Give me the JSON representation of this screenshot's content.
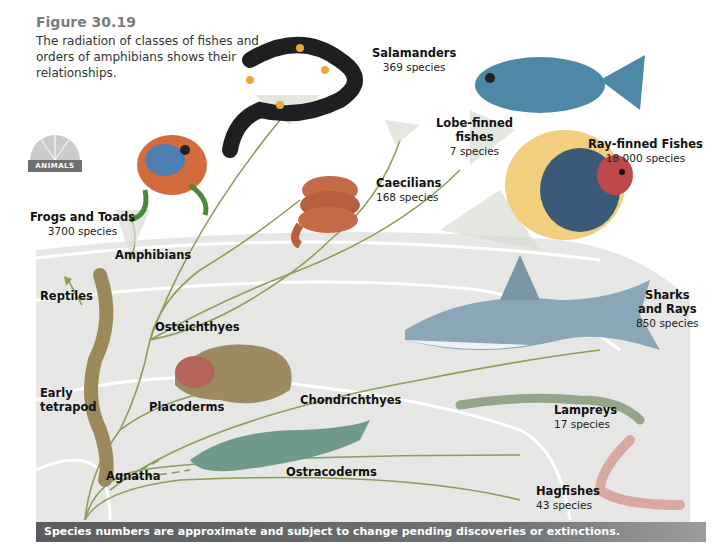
{
  "figure": {
    "title": "Figure 30.19",
    "caption": "The radiation of classes of fishes and orders of amphibians shows their relationships."
  },
  "badge": {
    "label": "ANIMALS",
    "icon": "nautilus-shell-icon"
  },
  "groups": {
    "frogs": {
      "name": "Frogs and Toads",
      "species": "3700 species"
    },
    "salamanders": {
      "name": "Salamanders",
      "species": "369 species"
    },
    "caecilians": {
      "name": "Caecilians",
      "species": "168 species"
    },
    "lobe_finned": {
      "name_line1": "Lobe-finned",
      "name_line2": "fishes",
      "species": "7 species"
    },
    "ray_finned": {
      "name": "Ray-finned Fishes",
      "species": "18 000 species"
    },
    "sharks": {
      "name_line1": "Sharks",
      "name_line2": "and Rays",
      "species": "850 species"
    },
    "lampreys": {
      "name": "Lampreys",
      "species": "17 species"
    },
    "hagfishes": {
      "name": "Hagfishes",
      "species": "43 species"
    }
  },
  "clades": {
    "amphibians": "Amphibians",
    "reptiles": "Reptiles",
    "osteichthyes": "Osteichthyes",
    "early_tetrapod_line1": "Early",
    "early_tetrapod_line2": "tetrapod",
    "placoderms": "Placoderms",
    "chondrichthyes": "Chondrichthyes",
    "agnatha": "Agnatha",
    "ostracoderms": "Ostracoderms"
  },
  "footer": {
    "note": "Species numbers are approximate and subject to change pending discoveries or extinctions."
  },
  "colors": {
    "branch": "#8aa05a",
    "arc_bg": "#e4e4e2",
    "arc_line": "#ffffff",
    "footer_bg": "#5f6163",
    "title": "#7a7d80"
  }
}
